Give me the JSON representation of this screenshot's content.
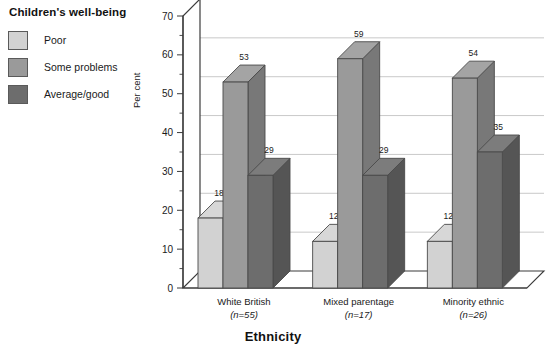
{
  "legend": {
    "title": "Children's well-being",
    "items": [
      {
        "label": "Poor",
        "color": "#d2d2d2"
      },
      {
        "label": "Some problems",
        "color": "#9a9a9a"
      },
      {
        "label": "Average/good",
        "color": "#6d6d6d"
      }
    ]
  },
  "chart_data": {
    "type": "bar",
    "title": "",
    "xlabel": "Ethnicity",
    "ylabel": "Per cent",
    "ylim": [
      0,
      70
    ],
    "ytick_step": 10,
    "yticks": [
      0,
      10,
      20,
      30,
      40,
      50,
      60,
      70
    ],
    "grid": true,
    "legend_position": "top-left",
    "style": "3d-grouped-column",
    "categories": [
      "White British",
      "Mixed parentage",
      "Minority ethnic"
    ],
    "category_notes": [
      "(n=55)",
      "(n=17)",
      "(n=26)"
    ],
    "series": [
      {
        "name": "Poor",
        "color": "#d2d2d2",
        "values": [
          18,
          12,
          12
        ]
      },
      {
        "name": "Some problems",
        "color": "#9a9a9a",
        "values": [
          53,
          59,
          54
        ]
      },
      {
        "name": "Average/good",
        "color": "#6d6d6d",
        "values": [
          29,
          29,
          35
        ]
      }
    ]
  }
}
